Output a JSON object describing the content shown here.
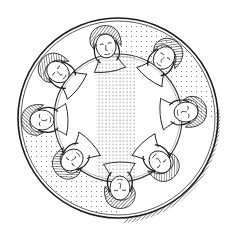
{
  "illustration": {
    "style": "engraving / line art",
    "subject": "circular plate with eight stylized faces arranged on an inner ring",
    "colors": {
      "ink": "#1a1a1a",
      "paper": "#ffffff",
      "stipple": "#555555"
    },
    "plate": {
      "center": [
        118,
        118
      ],
      "outer_radius": 100,
      "inner_ring_radius": 64,
      "rim": "hatched shading along lower-right edge"
    },
    "faces": [
      {
        "position": "top",
        "x": 106,
        "y": 46
      },
      {
        "position": "top-right",
        "x": 164,
        "y": 58
      },
      {
        "position": "right",
        "x": 186,
        "y": 112
      },
      {
        "position": "bottom-right",
        "x": 160,
        "y": 162
      },
      {
        "position": "bottom",
        "x": 120,
        "y": 188
      },
      {
        "position": "bottom-left",
        "x": 72,
        "y": 160
      },
      {
        "position": "left",
        "x": 42,
        "y": 120
      },
      {
        "position": "top-left",
        "x": 58,
        "y": 72
      }
    ]
  }
}
